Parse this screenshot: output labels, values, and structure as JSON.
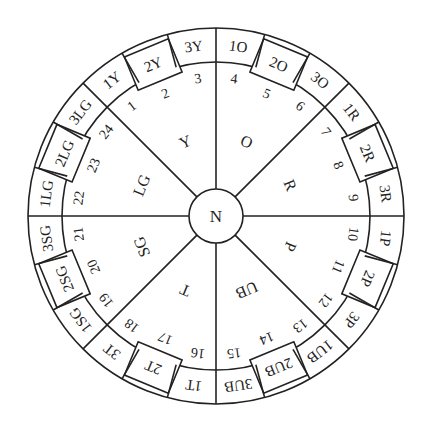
{
  "diagram": {
    "center_label": "N",
    "sectors": [
      {
        "label": "Y",
        "outer": [
          "1Y",
          "2Y",
          "3Y"
        ],
        "numbers": [
          "1",
          "2",
          "3"
        ]
      },
      {
        "label": "O",
        "outer": [
          "1O",
          "2O",
          "3O"
        ],
        "numbers": [
          "4",
          "5",
          "6"
        ]
      },
      {
        "label": "R",
        "outer": [
          "1R",
          "2R",
          "3R"
        ],
        "numbers": [
          "7",
          "8",
          "9"
        ]
      },
      {
        "label": "P",
        "outer": [
          "1P",
          "2P",
          "3P"
        ],
        "numbers": [
          "10",
          "11",
          "12"
        ]
      },
      {
        "label": "UB",
        "outer": [
          "1UB",
          "2UB",
          "3UB"
        ],
        "numbers": [
          "13",
          "14",
          "15"
        ]
      },
      {
        "label": "T",
        "outer": [
          "1T",
          "2T",
          "3T"
        ],
        "numbers": [
          "16",
          "17",
          "18"
        ]
      },
      {
        "label": "SG",
        "outer": [
          "1SG",
          "2SG",
          "3SG"
        ],
        "numbers": [
          "19",
          "20",
          "21"
        ]
      },
      {
        "label": "LG",
        "outer": [
          "1LG",
          "2LG",
          "3LG"
        ],
        "numbers": [
          "22",
          "23",
          "24"
        ]
      }
    ]
  }
}
